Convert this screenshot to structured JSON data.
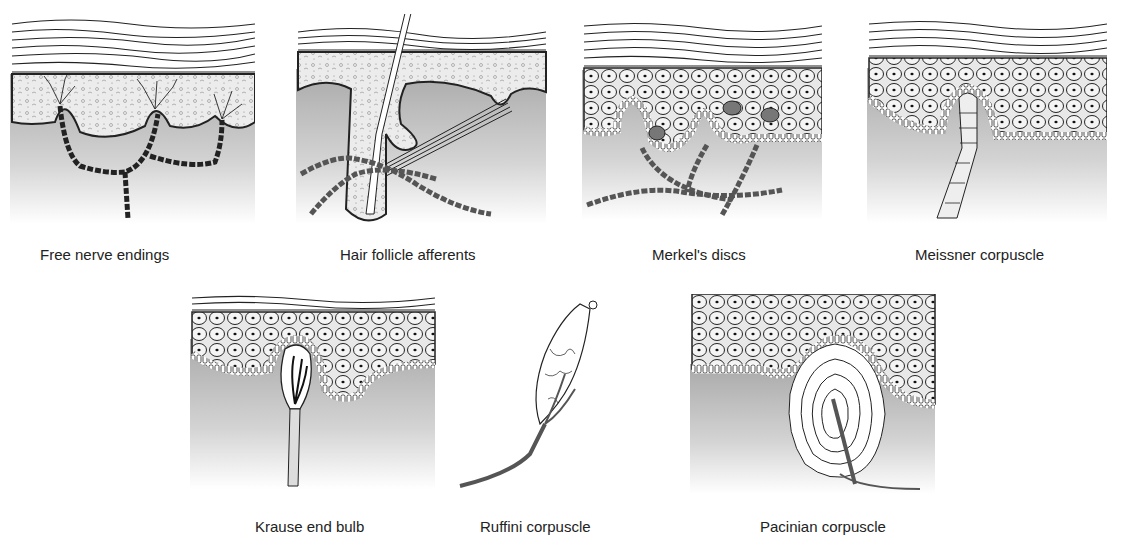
{
  "figure": {
    "panels": [
      {
        "id": "free-nerve-endings",
        "label": "Free nerve endings"
      },
      {
        "id": "hair-follicle-afferents",
        "label": "Hair follicle afferents"
      },
      {
        "id": "merkels-discs",
        "label": "Merkel's discs"
      },
      {
        "id": "meissner-corpuscle",
        "label": "Meissner corpuscle"
      },
      {
        "id": "krause-end-bulb",
        "label": "Krause end bulb"
      },
      {
        "id": "ruffini-corpuscle",
        "label": "Ruffini corpuscle"
      },
      {
        "id": "pacinian-corpuscle",
        "label": "Pacinian corpuscle"
      }
    ]
  }
}
